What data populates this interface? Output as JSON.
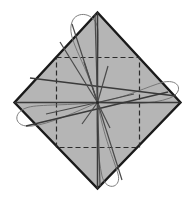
{
  "figure": {
    "canvas": {
      "width": 193,
      "height": 201,
      "background": "#ffffff"
    },
    "colors": {
      "diamond_fill": "#b5b5b5",
      "diamond_stroke": "#1a1a1a",
      "dashed_stroke": "#2b2b2b",
      "axis_stroke": "#3a3a3a",
      "spoke_stroke": "#4a4a4a",
      "loop_stroke": "#6f6f6f",
      "background": "#ffffff"
    },
    "strokes": {
      "diamond_width": 2.4,
      "dashed_width": 1.2,
      "dashed_pattern": "5,3",
      "axis_width": 1.5,
      "spoke_width": 1.2,
      "loop_width": 0.9
    },
    "center": {
      "x": 97.5,
      "y": 102.5
    },
    "diamond_vertices": [
      {
        "name": "top",
        "x": 97.5,
        "y": 12.5
      },
      {
        "name": "right",
        "x": 180.5,
        "y": 102.5
      },
      {
        "name": "bottom",
        "x": 97.5,
        "y": 188.5
      },
      {
        "name": "left",
        "x": 14.5,
        "y": 102.5
      }
    ],
    "dashed_square": {
      "x": 56.5,
      "y": 57.5,
      "width": 83,
      "height": 90
    },
    "axes": [
      {
        "name": "axis-vertical",
        "x1": 97.5,
        "y1": 12.5,
        "x2": 97.5,
        "y2": 188.5
      },
      {
        "name": "axis-horizontal",
        "x1": 14.5,
        "y1": 102.5,
        "x2": 180.5,
        "y2": 102.5
      },
      {
        "name": "axis-diagonal-nw-se",
        "x1": 30.0,
        "y1": 78.0,
        "x2": 176.0,
        "y2": 96.0
      },
      {
        "name": "axis-diagonal-ne-sw",
        "x1": 26.0,
        "y1": 126.0,
        "x2": 168.0,
        "y2": 92.0
      }
    ],
    "spokes": [
      {
        "name": "spoke-up",
        "x1": 97.5,
        "y1": 102.5,
        "x2": 95.0,
        "y2": 14.0
      },
      {
        "name": "spoke-down",
        "x1": 97.5,
        "y1": 102.5,
        "x2": 100.0,
        "y2": 186.0
      },
      {
        "name": "spoke-upper-left",
        "x1": 97.5,
        "y1": 102.5,
        "x2": 72.0,
        "y2": 24.0
      },
      {
        "name": "spoke-upper-left-2",
        "x1": 97.5,
        "y1": 102.5,
        "x2": 84.0,
        "y2": 62.0
      },
      {
        "name": "spoke-upper-right",
        "x1": 97.5,
        "y1": 102.5,
        "x2": 108.0,
        "y2": 66.0
      },
      {
        "name": "spoke-right-shallow",
        "x1": 97.5,
        "y1": 102.5,
        "x2": 134.0,
        "y2": 94.0
      },
      {
        "name": "spoke-left-shallow",
        "x1": 97.5,
        "y1": 102.5,
        "x2": 46.0,
        "y2": 114.0
      },
      {
        "name": "spoke-lower-left",
        "x1": 97.5,
        "y1": 102.5,
        "x2": 82.0,
        "y2": 124.0
      },
      {
        "name": "spoke-lower-right",
        "x1": 97.5,
        "y1": 102.5,
        "x2": 110.0,
        "y2": 128.0
      },
      {
        "name": "spoke-lower-right-long",
        "x1": 97.5,
        "y1": 102.5,
        "x2": 122.0,
        "y2": 180.0
      },
      {
        "name": "spoke-upper-left-long",
        "x1": 97.5,
        "y1": 102.5,
        "x2": 60.0,
        "y2": 42.0
      }
    ],
    "loops": [
      {
        "name": "loop-top",
        "path": "M 97.5 102.5 C 84 58, 66 38, 72 22 C 76 10, 96 12, 98 30 C 99 46, 96 72, 97.5 102.5 Z"
      },
      {
        "name": "loop-left",
        "path": "M 97.5 102.5 C 62 106, 36 104, 26 108 C 12 113, 14 128, 32 126 C 50 124, 76 112, 97.5 102.5 Z"
      },
      {
        "name": "loop-right",
        "path": "M 97.5 102.5 C 126 98, 148 86, 164 82 C 180 79, 184 92, 170 98 C 152 105, 122 104, 97.5 102.5 Z"
      },
      {
        "name": "loop-bottom",
        "path": "M 97.5 102.5 C 104 138, 114 160, 118 174 C 122 188, 106 192, 102 176 C 98 158, 96 126, 97.5 102.5 Z"
      }
    ]
  }
}
